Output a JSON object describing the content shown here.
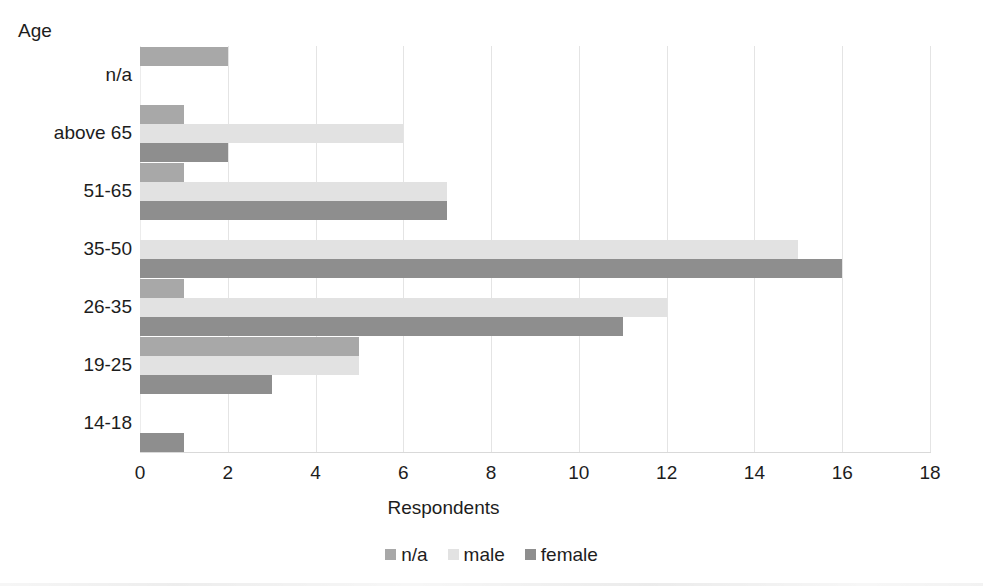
{
  "chart_data": {
    "type": "bar",
    "orientation": "horizontal",
    "title": "",
    "xlabel": "Respondents",
    "ylabel": "Age",
    "categories": [
      "n/a",
      "above 65",
      "51-65",
      "35-50",
      "26-35",
      "19-25",
      "14-18"
    ],
    "series": [
      {
        "name": "n/a",
        "color": "#a8a8a8",
        "values": [
          2,
          1,
          1,
          0,
          1,
          5,
          0
        ]
      },
      {
        "name": "male",
        "color": "#e2e2e2",
        "values": [
          0,
          6,
          7,
          15,
          12,
          5,
          0
        ]
      },
      {
        "name": "female",
        "color": "#8e8e8e",
        "values": [
          0,
          2,
          7,
          16,
          11,
          3,
          1
        ]
      }
    ],
    "xlim": [
      0,
      18
    ],
    "xticks": [
      "0",
      "2",
      "4",
      "6",
      "8",
      "10",
      "12",
      "14",
      "16",
      "18"
    ],
    "xtick_values": [
      0,
      2,
      4,
      6,
      8,
      10,
      12,
      14,
      16,
      18
    ],
    "grid": "vertical-only",
    "legend_position": "bottom",
    "legend_entries": [
      "n/a",
      "male",
      "female"
    ],
    "background_color": "#ffffff",
    "gridline_color": "#e4e4e4",
    "text_color": "#1d1d1d"
  }
}
